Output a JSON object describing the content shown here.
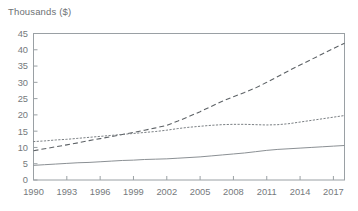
{
  "chart": {
    "axis_title": "Thousands ($)",
    "frame_color": "#9aa0a4",
    "text_color": "#75797c"
  },
  "chart_data": {
    "type": "line",
    "title": "Thousands ($)",
    "xlabel": "",
    "ylabel": "Thousands ($)",
    "xlim": [
      1990,
      2018
    ],
    "ylim": [
      0,
      45
    ],
    "grid": false,
    "legend": "none",
    "yticks": [
      0,
      5,
      10,
      15,
      20,
      25,
      30,
      35,
      40,
      45
    ],
    "xticks": [
      1990,
      1993,
      1996,
      1999,
      2002,
      2005,
      2008,
      2011,
      2014,
      2017
    ],
    "x": [
      1990,
      1991,
      1992,
      1993,
      1994,
      1995,
      1996,
      1997,
      1998,
      1999,
      2000,
      2001,
      2002,
      2003,
      2004,
      2005,
      2006,
      2007,
      2008,
      2009,
      2010,
      2011,
      2012,
      2013,
      2014,
      2015,
      2016,
      2017,
      2018
    ],
    "series": [
      {
        "name": "series-dashed",
        "style": "dashed",
        "color": "#5d6266",
        "values": [
          9.0,
          9.6,
          10.2,
          10.8,
          11.4,
          12.1,
          12.7,
          13.3,
          14.0,
          14.6,
          15.3,
          16.0,
          16.8,
          18.1,
          19.5,
          21.0,
          22.6,
          24.2,
          25.6,
          26.9,
          28.3,
          30.0,
          31.8,
          33.6,
          35.3,
          37.0,
          38.7,
          40.4,
          42.0
        ]
      },
      {
        "name": "series-dotted",
        "style": "dotted",
        "color": "#7b8084",
        "values": [
          11.8,
          12.0,
          12.3,
          12.5,
          12.8,
          13.1,
          13.4,
          13.7,
          14.0,
          14.3,
          14.6,
          14.9,
          15.3,
          15.8,
          16.2,
          16.5,
          16.8,
          17.0,
          17.1,
          17.1,
          17.0,
          16.9,
          17.0,
          17.3,
          17.8,
          18.3,
          18.8,
          19.3,
          19.8
        ]
      },
      {
        "name": "series-solid",
        "style": "solid",
        "color": "#8b9094",
        "values": [
          4.5,
          4.7,
          4.9,
          5.1,
          5.3,
          5.4,
          5.6,
          5.8,
          6.0,
          6.1,
          6.3,
          6.4,
          6.5,
          6.7,
          6.9,
          7.1,
          7.4,
          7.7,
          8.0,
          8.3,
          8.7,
          9.1,
          9.4,
          9.6,
          9.8,
          10.0,
          10.2,
          10.4,
          10.6
        ]
      }
    ]
  }
}
